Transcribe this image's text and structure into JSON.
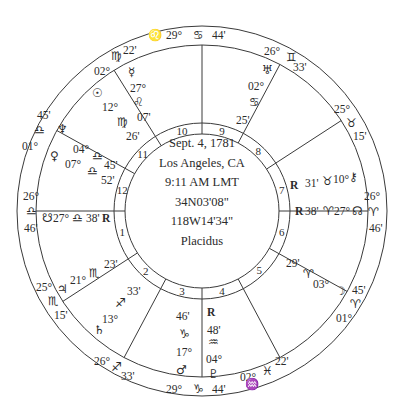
{
  "chart_info": {
    "date": "Sept. 4, 1781",
    "place": "Los Angeles, CA",
    "time": "9:11 AM LMT",
    "latitude": "34N03'08\"",
    "longitude": "118W14'34\"",
    "house_system": "Placidus"
  },
  "geometry": {
    "center": [
      202,
      211
    ],
    "outer_radius": 185,
    "sign_ring_radius": 166,
    "house_ring_outer": 88,
    "house_ring_inner": 77
  },
  "colors": {
    "line": "#3a3a3a",
    "text": "#2b2b2b",
    "background": "#ffffff"
  },
  "house_cusps": [
    {
      "house": 1,
      "angle": 180,
      "label_angle": 195
    },
    {
      "house": 2,
      "angle": 213,
      "label_angle": 227
    },
    {
      "house": 3,
      "angle": 242,
      "label_angle": 256
    },
    {
      "house": 4,
      "angle": 270,
      "label_angle": 284
    },
    {
      "house": 5,
      "angle": 298,
      "label_angle": 314
    },
    {
      "house": 6,
      "angle": 331,
      "label_angle": 345
    },
    {
      "house": 7,
      "angle": 0,
      "label_angle": 15
    },
    {
      "house": 8,
      "angle": 33,
      "label_angle": 47
    },
    {
      "house": 9,
      "angle": 62,
      "label_angle": 76
    },
    {
      "house": 10,
      "angle": 90,
      "label_angle": 104
    },
    {
      "house": 11,
      "angle": 122,
      "label_angle": 136
    },
    {
      "house": 12,
      "angle": 151,
      "label_angle": 165
    }
  ],
  "cusp_labels": [
    {
      "name": "mc",
      "parts": [
        {
          "t": "29°",
          "x": 166,
          "y": 39
        },
        {
          "t": "♋",
          "x": 193,
          "y": 39,
          "g": 1
        },
        {
          "t": "44'",
          "x": 212,
          "y": 39
        }
      ]
    },
    {
      "name": "ic",
      "parts": [
        {
          "t": "29°",
          "x": 166,
          "y": 393
        },
        {
          "t": "♑",
          "x": 193,
          "y": 393,
          "g": 1
        },
        {
          "t": "44'",
          "x": 212,
          "y": 393
        }
      ]
    },
    {
      "name": "asc",
      "parts": [
        {
          "t": "26°",
          "x": 23,
          "y": 200
        },
        {
          "t": "♎",
          "x": 26,
          "y": 215,
          "g": 1
        },
        {
          "t": "46'",
          "x": 24,
          "y": 232
        }
      ]
    },
    {
      "name": "dsc",
      "parts": [
        {
          "t": "26°",
          "x": 364,
          "y": 200
        },
        {
          "t": "♈",
          "x": 368,
          "y": 216,
          "g": 1
        },
        {
          "t": "46'",
          "x": 369,
          "y": 232
        }
      ]
    },
    {
      "name": "cusp-11",
      "parts": [
        {
          "t": "02°",
          "x": 94,
          "y": 75
        },
        {
          "t": "♍",
          "x": 111,
          "y": 60,
          "g": 1
        },
        {
          "t": "22'",
          "x": 123,
          "y": 54
        }
      ]
    },
    {
      "name": "cusp-12",
      "parts": [
        {
          "t": "45'",
          "x": 37,
          "y": 119
        },
        {
          "t": "♎",
          "x": 34,
          "y": 134,
          "g": 1
        },
        {
          "t": "01°",
          "x": 22,
          "y": 150
        }
      ]
    },
    {
      "name": "cusp-9",
      "parts": [
        {
          "t": "26°",
          "x": 264,
          "y": 55
        },
        {
          "t": "♊",
          "x": 286,
          "y": 61,
          "g": 1
        },
        {
          "t": "33'",
          "x": 293,
          "y": 71
        }
      ]
    },
    {
      "name": "cusp-8",
      "parts": [
        {
          "t": "25°",
          "x": 334,
          "y": 113
        },
        {
          "t": "♉",
          "x": 346,
          "y": 127,
          "g": 1
        },
        {
          "t": "15'",
          "x": 353,
          "y": 140
        }
      ]
    },
    {
      "name": "cusp-2",
      "parts": [
        {
          "t": "25°",
          "x": 36,
          "y": 291
        },
        {
          "t": "♏",
          "x": 48,
          "y": 305,
          "g": 1
        },
        {
          "t": "15'",
          "x": 54,
          "y": 319
        }
      ]
    },
    {
      "name": "cusp-3",
      "parts": [
        {
          "t": "26°",
          "x": 94,
          "y": 365
        },
        {
          "t": "♐",
          "x": 111,
          "y": 371,
          "g": 1
        },
        {
          "t": "33'",
          "x": 121,
          "y": 380
        }
      ]
    },
    {
      "name": "cusp-5",
      "parts": [
        {
          "t": "22'",
          "x": 275,
          "y": 365
        },
        {
          "t": "♓",
          "x": 262,
          "y": 375,
          "g": 1
        },
        {
          "t": "02°",
          "x": 240,
          "y": 381
        }
      ]
    },
    {
      "name": "cusp-6",
      "parts": [
        {
          "t": "45'",
          "x": 352,
          "y": 294
        },
        {
          "t": "♈",
          "x": 350,
          "y": 308,
          "g": 1
        },
        {
          "t": "01°",
          "x": 336,
          "y": 322
        }
      ]
    }
  ],
  "sign_ring_glyphs": [
    {
      "name": "leo-ring",
      "t": "♌",
      "x": 148,
      "y": 39
    }
  ],
  "planets": [
    {
      "name": "mercury",
      "parts": [
        {
          "t": "☿",
          "x": 128,
          "y": 76,
          "g": 1
        },
        {
          "t": "27°",
          "x": 130,
          "y": 92
        },
        {
          "t": "♌",
          "x": 133,
          "y": 106,
          "g": 1
        },
        {
          "t": "07'",
          "x": 137,
          "y": 121
        }
      ]
    },
    {
      "name": "sun",
      "parts": [
        {
          "t": "☉",
          "x": 92,
          "y": 97,
          "g": 1
        },
        {
          "t": "12°",
          "x": 102,
          "y": 111
        },
        {
          "t": "♍",
          "x": 117,
          "y": 126,
          "g": 1
        },
        {
          "t": "26'",
          "x": 126,
          "y": 140
        }
      ]
    },
    {
      "name": "uranus",
      "parts": [
        {
          "t": "♅",
          "x": 262,
          "y": 74,
          "g": 1
        },
        {
          "t": "02°",
          "x": 248,
          "y": 90
        },
        {
          "t": "♋",
          "x": 249,
          "y": 106,
          "g": 1
        },
        {
          "t": "25'",
          "x": 236,
          "y": 124
        }
      ]
    },
    {
      "name": "neptune",
      "parts": [
        {
          "t": "♆",
          "x": 57,
          "y": 133,
          "g": 1
        },
        {
          "t": "04°",
          "x": 73,
          "y": 153
        },
        {
          "t": "♎",
          "x": 92,
          "y": 160,
          "g": 1
        },
        {
          "t": "45'",
          "x": 104,
          "y": 169
        }
      ]
    },
    {
      "name": "venus",
      "parts": [
        {
          "t": "♀",
          "x": 50,
          "y": 160,
          "g": 1
        },
        {
          "t": "07°",
          "x": 65,
          "y": 168
        },
        {
          "t": "♎",
          "x": 87,
          "y": 175,
          "g": 1
        },
        {
          "t": "52'",
          "x": 101,
          "y": 184
        }
      ]
    },
    {
      "name": "chiron",
      "parts": [
        {
          "t": "R",
          "x": 290,
          "y": 189,
          "r": 1
        },
        {
          "t": "31'",
          "x": 305,
          "y": 187
        },
        {
          "t": "♉",
          "x": 322,
          "y": 185,
          "g": 1
        },
        {
          "t": "10°",
          "x": 333,
          "y": 183
        },
        {
          "t": "⚷",
          "x": 349,
          "y": 181,
          "g": 1
        }
      ]
    },
    {
      "name": "north-node",
      "parts": [
        {
          "t": "R",
          "x": 295,
          "y": 215,
          "r": 1
        },
        {
          "t": "38'",
          "x": 305,
          "y": 215
        },
        {
          "t": "♈",
          "x": 323,
          "y": 215,
          "g": 1
        },
        {
          "t": "27°",
          "x": 334,
          "y": 215
        },
        {
          "t": "☊",
          "x": 352,
          "y": 215,
          "g": 1
        }
      ]
    },
    {
      "name": "south-node",
      "parts": [
        {
          "t": "☋",
          "x": 42,
          "y": 222,
          "g": 1
        },
        {
          "t": "27°",
          "x": 53,
          "y": 222
        },
        {
          "t": "♎",
          "x": 72,
          "y": 222,
          "g": 1
        },
        {
          "t": "38'",
          "x": 86,
          "y": 222
        },
        {
          "t": "R",
          "x": 102,
          "y": 222,
          "r": 1
        }
      ]
    },
    {
      "name": "jupiter",
      "parts": [
        {
          "t": "♃",
          "x": 57,
          "y": 293,
          "g": 1
        },
        {
          "t": "21°",
          "x": 70,
          "y": 284
        },
        {
          "t": "♏",
          "x": 89,
          "y": 277,
          "g": 1
        },
        {
          "t": "23'",
          "x": 104,
          "y": 268
        }
      ]
    },
    {
      "name": "saturn",
      "parts": [
        {
          "t": "♄",
          "x": 94,
          "y": 334,
          "g": 1
        },
        {
          "t": "13°",
          "x": 102,
          "y": 323
        },
        {
          "t": "♐",
          "x": 115,
          "y": 307,
          "g": 1
        },
        {
          "t": "33'",
          "x": 127,
          "y": 295
        }
      ]
    },
    {
      "name": "moon",
      "parts": [
        {
          "t": "29'",
          "x": 286,
          "y": 267
        },
        {
          "t": "♈",
          "x": 303,
          "y": 278,
          "g": 1
        },
        {
          "t": "03°",
          "x": 313,
          "y": 288
        },
        {
          "t": "☽",
          "x": 335,
          "y": 295,
          "g": 1
        }
      ]
    },
    {
      "name": "mars",
      "parts": [
        {
          "t": "46'",
          "x": 176,
          "y": 320
        },
        {
          "t": "♑",
          "x": 179,
          "y": 338,
          "g": 1
        },
        {
          "t": "17°",
          "x": 176,
          "y": 356
        },
        {
          "t": "♂",
          "x": 176,
          "y": 374,
          "g": 1
        }
      ]
    },
    {
      "name": "pluto",
      "parts": [
        {
          "t": "R",
          "x": 207,
          "y": 316,
          "r": 1
        },
        {
          "t": "48'",
          "x": 207,
          "y": 334
        },
        {
          "t": "♒",
          "x": 208,
          "y": 346,
          "g": 1
        },
        {
          "t": "04°",
          "x": 206,
          "y": 363
        },
        {
          "t": "♇",
          "x": 208,
          "y": 378,
          "g": 1
        }
      ]
    }
  ],
  "ic_extra": [
    {
      "name": "aquarius-ring",
      "t": "♒",
      "x": 245,
      "y": 388
    }
  ]
}
